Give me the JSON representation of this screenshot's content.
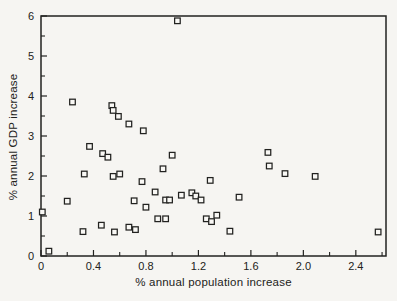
{
  "figure": {
    "title": "",
    "kind": "scanned textbook scatter plot"
  },
  "colors": {
    "ink": "#222220",
    "paper": "#f6f5f2",
    "marker_fill": "#f9f8f5"
  },
  "chart_data": {
    "type": "scatter",
    "title": "",
    "xlabel": "% annual population increase",
    "ylabel": "% annual GDP increase",
    "xlim": [
      0,
      2.63
    ],
    "ylim": [
      0,
      6
    ],
    "grid": false,
    "legend": "none",
    "marker": "open-square",
    "x_ticks_major": [
      0,
      0.4,
      0.8,
      1.2,
      1.6,
      2.0,
      2.4
    ],
    "x_tick_labels": [
      "0",
      "0.4",
      "0.8",
      "1.2",
      "1.6",
      "2.0",
      "2.4"
    ],
    "x_minor_step": 0.2,
    "y_ticks_major": [
      0,
      1,
      2,
      3,
      4,
      5,
      6
    ],
    "y_tick_labels": [
      "0",
      "1",
      "2",
      "3",
      "4",
      "5",
      "6"
    ],
    "y_minor_step": 0.5,
    "points": [
      [
        1.04,
        5.88
      ],
      [
        0.24,
        3.85
      ],
      [
        0.54,
        3.76
      ],
      [
        0.55,
        3.64
      ],
      [
        0.59,
        3.49
      ],
      [
        0.67,
        3.3
      ],
      [
        0.78,
        3.13
      ],
      [
        0.37,
        2.74
      ],
      [
        0.47,
        2.56
      ],
      [
        0.51,
        2.47
      ],
      [
        1.0,
        2.52
      ],
      [
        1.73,
        2.59
      ],
      [
        1.74,
        2.25
      ],
      [
        1.86,
        2.06
      ],
      [
        2.09,
        1.99
      ],
      [
        0.33,
        2.05
      ],
      [
        0.55,
        1.99
      ],
      [
        0.6,
        2.05
      ],
      [
        0.77,
        1.86
      ],
      [
        0.93,
        2.18
      ],
      [
        1.29,
        1.89
      ],
      [
        0.87,
        1.6
      ],
      [
        1.07,
        1.52
      ],
      [
        1.15,
        1.58
      ],
      [
        1.18,
        1.5
      ],
      [
        1.22,
        1.4
      ],
      [
        1.51,
        1.47
      ],
      [
        0.2,
        1.37
      ],
      [
        0.71,
        1.38
      ],
      [
        0.95,
        1.4
      ],
      [
        0.98,
        1.4
      ],
      [
        0.01,
        1.1
      ],
      [
        0.8,
        1.22
      ],
      [
        0.89,
        0.93
      ],
      [
        0.95,
        0.93
      ],
      [
        1.26,
        0.93
      ],
      [
        1.3,
        0.86
      ],
      [
        1.34,
        1.02
      ],
      [
        1.44,
        0.62
      ],
      [
        0.32,
        0.61
      ],
      [
        0.46,
        0.77
      ],
      [
        0.56,
        0.6
      ],
      [
        0.67,
        0.72
      ],
      [
        0.72,
        0.66
      ],
      [
        0.06,
        0.12
      ],
      [
        2.57,
        0.6
      ]
    ]
  }
}
